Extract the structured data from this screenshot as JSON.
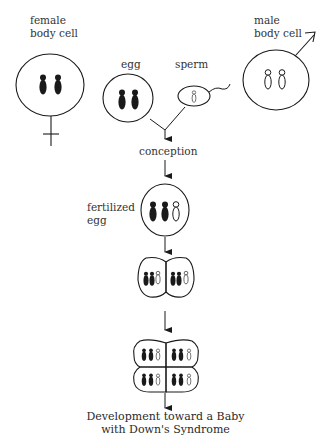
{
  "diagram": {
    "labels": {
      "female_body_cell_line1": "female",
      "female_body_cell_line2": "body cell",
      "male_body_cell_line1": "male",
      "male_body_cell_line2": "body cell",
      "egg": "egg",
      "sperm": "sperm",
      "conception": "conception",
      "fertilized_egg_line1": "fertilized",
      "fertilized_egg_line2": "egg",
      "caption_line1": "Development toward a Baby",
      "caption_line2": "with Down's Syndrome"
    },
    "nodes": [
      {
        "id": "female-body-cell",
        "symbol": "female-symbol",
        "chromosomes": {
          "maternal_black": 2,
          "paternal_white": 0
        }
      },
      {
        "id": "male-body-cell",
        "symbol": "male-symbol",
        "chromosomes": {
          "maternal_black": 0,
          "paternal_white": 2
        }
      },
      {
        "id": "egg",
        "chromosomes": {
          "maternal_black": 2,
          "paternal_white": 0
        }
      },
      {
        "id": "sperm",
        "chromosomes": {
          "maternal_black": 0,
          "paternal_white": 1
        }
      },
      {
        "id": "fertilized-egg",
        "chromosomes": {
          "maternal_black": 2,
          "paternal_white": 1
        }
      },
      {
        "id": "two-cell-stage",
        "cells": 2,
        "chromosomes_per_cell": {
          "maternal_black": 2,
          "paternal_white": 1
        }
      },
      {
        "id": "four-cell-stage",
        "cells": 4,
        "chromosomes_per_cell": {
          "maternal_black": 2,
          "paternal_white": 1
        }
      }
    ],
    "edges": [
      [
        "egg",
        "conception"
      ],
      [
        "sperm",
        "conception"
      ],
      [
        "conception",
        "fertilized-egg"
      ],
      [
        "fertilized-egg",
        "two-cell-stage"
      ],
      [
        "two-cell-stage",
        "four-cell-stage"
      ],
      [
        "four-cell-stage",
        "caption"
      ]
    ],
    "colors": {
      "ink": "#1a1a1a",
      "background": "#ffffff"
    }
  }
}
